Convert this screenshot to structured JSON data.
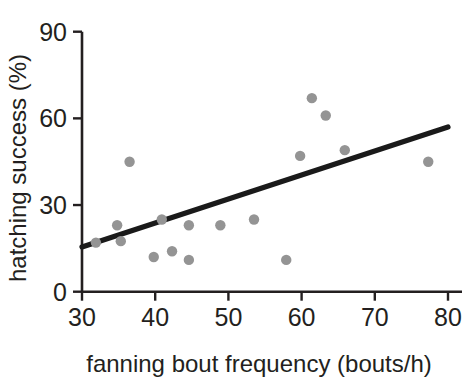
{
  "chart_data": {
    "type": "scatter",
    "title": "",
    "xlabel": "fanning bout frequency (bouts/h)",
    "ylabel": "hatching success (%)",
    "xlim": [
      30,
      80
    ],
    "ylim": [
      0,
      90
    ],
    "xticks": [
      30,
      40,
      50,
      60,
      70,
      80
    ],
    "yticks": [
      0,
      30,
      60,
      90
    ],
    "xtick_labels": [
      "30",
      "40",
      "50",
      "60",
      "70",
      "80"
    ],
    "ytick_labels": [
      "0",
      "30",
      "60",
      "90"
    ],
    "grid": false,
    "legend": null,
    "marker_color": "#949494",
    "line_color": "#1a1a1a",
    "axis_color": "#231f20",
    "series": [
      {
        "name": "nests",
        "marker": "circle",
        "points": [
          {
            "x": 31.9,
            "y": 17.0
          },
          {
            "x": 34.8,
            "y": 23.0
          },
          {
            "x": 35.3,
            "y": 17.5
          },
          {
            "x": 36.5,
            "y": 45.0
          },
          {
            "x": 39.8,
            "y": 12.0
          },
          {
            "x": 40.9,
            "y": 25.0
          },
          {
            "x": 42.3,
            "y": 14.0
          },
          {
            "x": 44.6,
            "y": 11.0
          },
          {
            "x": 44.6,
            "y": 23.0
          },
          {
            "x": 48.9,
            "y": 23.0
          },
          {
            "x": 53.5,
            "y": 25.0
          },
          {
            "x": 57.9,
            "y": 11.0
          },
          {
            "x": 59.8,
            "y": 47.0
          },
          {
            "x": 61.4,
            "y": 67.0
          },
          {
            "x": 63.3,
            "y": 61.0
          },
          {
            "x": 65.9,
            "y": 49.0
          },
          {
            "x": 77.3,
            "y": 45.0
          }
        ]
      }
    ],
    "trend_line": {
      "name": "regression line",
      "x_start": 30,
      "y_start": 15.5,
      "x_end": 80,
      "y_end": 57.0
    }
  }
}
